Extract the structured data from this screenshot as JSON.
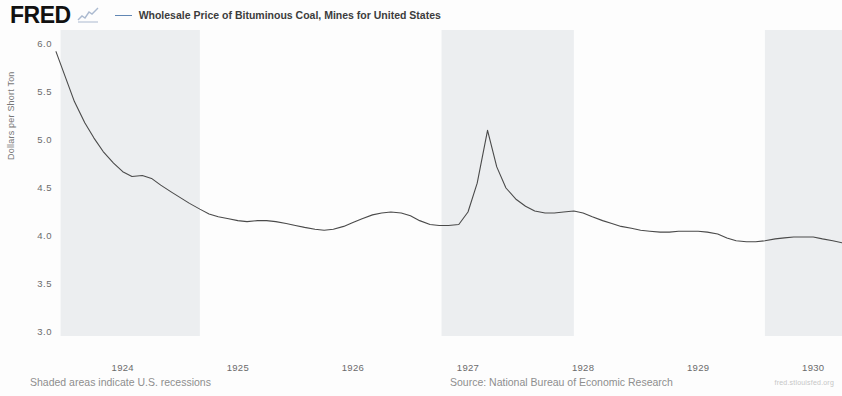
{
  "header": {
    "logo_text": "FRED",
    "logo_mark": "sparkline-icon",
    "legend": [
      {
        "label": "Wholesale Price of Bituminous Coal, Mines for United States",
        "color": "#4572a7"
      }
    ]
  },
  "footer": {
    "recession_note": "Shaded areas indicate U.S. recessions",
    "source": "Source: National Bureau of Economic Research",
    "url": "fred.stlouisfed.org"
  },
  "chart_data": {
    "type": "line",
    "title": "Wholesale Price of Bituminous Coal, Mines for United States",
    "xlabel": "",
    "ylabel": "Dollars per Short Ton",
    "ylim": [
      3.0,
      6.0
    ],
    "xlim": [
      1923.42,
      1930.25
    ],
    "grid": false,
    "legend_position": "top",
    "y_ticks": [
      "6.0",
      "5.5",
      "5.0",
      "4.5",
      "4.0",
      "3.5",
      "3.0"
    ],
    "y_tick_values": [
      6.0,
      5.5,
      5.0,
      4.5,
      4.0,
      3.5,
      3.0
    ],
    "x_ticks": [
      "1924",
      "1925",
      "1926",
      "1927",
      "1928",
      "1929",
      "1930"
    ],
    "x_tick_values": [
      1924,
      1925,
      1926,
      1927,
      1928,
      1929,
      1930
    ],
    "line_color": "#4a4a4a",
    "recession_color": "#eceef0",
    "recession_bands": [
      {
        "start": 1923.46,
        "end": 1924.67
      },
      {
        "start": 1926.77,
        "end": 1927.92
      },
      {
        "start": 1929.58,
        "end": 1930.25
      }
    ],
    "series": [
      {
        "name": "Wholesale Price of Bituminous Coal, Mines for United States",
        "color": "#4a4a4a",
        "x": [
          1923.42,
          1923.5,
          1923.58,
          1923.67,
          1923.75,
          1923.83,
          1923.92,
          1924.0,
          1924.08,
          1924.17,
          1924.25,
          1924.33,
          1924.42,
          1924.5,
          1924.58,
          1924.67,
          1924.75,
          1924.83,
          1924.92,
          1925.0,
          1925.08,
          1925.17,
          1925.25,
          1925.33,
          1925.42,
          1925.5,
          1925.58,
          1925.67,
          1925.75,
          1925.83,
          1925.92,
          1926.0,
          1926.08,
          1926.17,
          1926.25,
          1926.33,
          1926.42,
          1926.5,
          1926.58,
          1926.67,
          1926.75,
          1926.83,
          1926.92,
          1927.0,
          1927.08,
          1927.17,
          1927.25,
          1927.33,
          1927.42,
          1927.5,
          1927.58,
          1927.67,
          1927.75,
          1927.83,
          1927.92,
          1928.0,
          1928.08,
          1928.17,
          1928.25,
          1928.33,
          1928.42,
          1928.5,
          1928.58,
          1928.67,
          1928.75,
          1928.83,
          1928.92,
          1929.0,
          1929.08,
          1929.17,
          1929.25,
          1929.33,
          1929.42,
          1929.5,
          1929.58,
          1929.67,
          1929.75,
          1929.83,
          1929.92,
          1930.0,
          1930.08,
          1930.17,
          1930.25
        ],
        "y": [
          5.92,
          5.66,
          5.4,
          5.18,
          5.02,
          4.88,
          4.76,
          4.67,
          4.62,
          4.63,
          4.6,
          4.53,
          4.46,
          4.4,
          4.34,
          4.28,
          4.23,
          4.2,
          4.18,
          4.16,
          4.15,
          4.16,
          4.16,
          4.15,
          4.13,
          4.11,
          4.09,
          4.07,
          4.06,
          4.07,
          4.1,
          4.14,
          4.18,
          4.22,
          4.24,
          4.25,
          4.24,
          4.21,
          4.16,
          4.12,
          4.11,
          4.11,
          4.12,
          4.25,
          4.55,
          5.1,
          4.72,
          4.5,
          4.38,
          4.31,
          4.26,
          4.24,
          4.24,
          4.25,
          4.26,
          4.24,
          4.2,
          4.16,
          4.13,
          4.1,
          4.08,
          4.06,
          4.05,
          4.04,
          4.04,
          4.05,
          4.05,
          4.05,
          4.04,
          4.02,
          3.98,
          3.95,
          3.94,
          3.94,
          3.95,
          3.97,
          3.98,
          3.99,
          3.99,
          3.99,
          3.97,
          3.95,
          3.93
        ]
      }
    ]
  }
}
